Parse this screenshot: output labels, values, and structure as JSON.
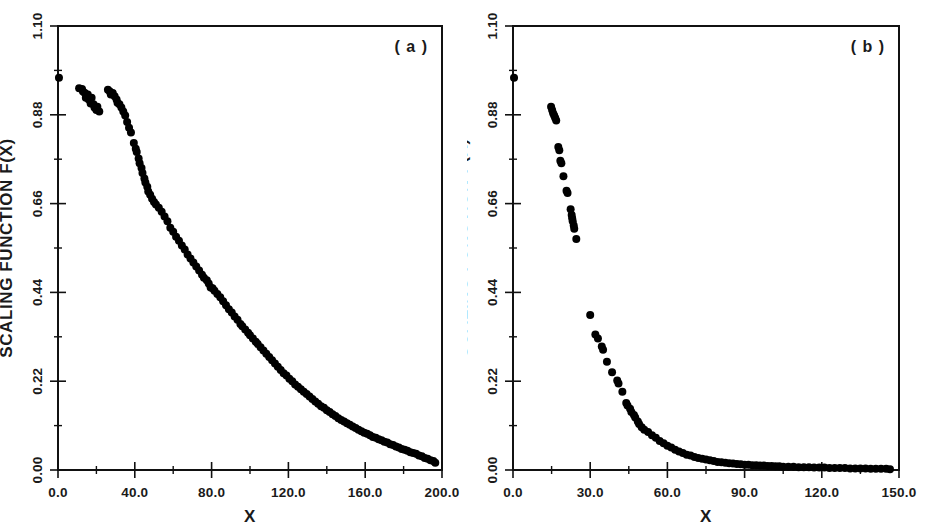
{
  "figure": {
    "panels": [
      {
        "tag": "( a )",
        "xlabel": "X",
        "ylabel": "SCALING FUNCTION F(X)",
        "xticks": [
          "0.0",
          "40.0",
          "80.0",
          "120.0",
          "160.0",
          "200.0"
        ],
        "yticks": [
          "1.10",
          "0.88",
          "0.66",
          "0.44",
          "0.22",
          "0.00"
        ]
      },
      {
        "tag": "( b )",
        "xlabel": "X",
        "ylabel": "SCALING FUNCTION F(X)",
        "xticks": [
          "0.0",
          "30.0",
          "60.0",
          "90.0",
          "120.0",
          "150.0"
        ],
        "yticks": [
          "1.10",
          "0.88",
          "0.66",
          "0.44",
          "0.22",
          "0.00"
        ]
      }
    ]
  },
  "chart_data": [
    {
      "type": "scatter",
      "title": "( a )",
      "xlabel": "X",
      "ylabel": "SCALING FUNCTION F(X)",
      "xlim": [
        0,
        200
      ],
      "ylim": [
        0.0,
        1.1
      ],
      "xticks": [
        0,
        40,
        80,
        120,
        160,
        200
      ],
      "yticks": [
        0.0,
        0.22,
        0.44,
        0.66,
        0.88,
        1.1
      ],
      "xtick_labels": [
        "0.0",
        "40.0",
        "80.0",
        "120.0",
        "160.0",
        "200.0"
      ],
      "ytick_labels": [
        "0.00",
        "0.22",
        "0.44",
        "0.66",
        "0.88",
        "1.10"
      ],
      "grid": false,
      "legend": "none",
      "marker": "filled-circle",
      "marker_color": "#000000",
      "marker_size_px": 8,
      "series": [
        {
          "name": "scaling function (a)",
          "points": [
            [
              0.5,
              0.972
            ],
            [
              11.0,
              0.946
            ],
            [
              12.5,
              0.944
            ],
            [
              13.0,
              0.938
            ],
            [
              14.0,
              0.934
            ],
            [
              14.5,
              0.922
            ],
            [
              15.5,
              0.93
            ],
            [
              16.0,
              0.918
            ],
            [
              17.0,
              0.908
            ],
            [
              17.5,
              0.922
            ],
            [
              18.5,
              0.906
            ],
            [
              19.0,
              0.898
            ],
            [
              20.0,
              0.892
            ],
            [
              20.5,
              0.9
            ],
            [
              21.5,
              0.888
            ],
            [
              26.0,
              0.942
            ],
            [
              27.0,
              0.938
            ],
            [
              27.5,
              0.93
            ],
            [
              28.5,
              0.934
            ],
            [
              29.5,
              0.926
            ],
            [
              30.5,
              0.918
            ],
            [
              31.0,
              0.91
            ],
            [
              32.0,
              0.906
            ],
            [
              33.0,
              0.898
            ],
            [
              34.0,
              0.888
            ],
            [
              35.0,
              0.878
            ],
            [
              36.0,
              0.862
            ],
            [
              37.0,
              0.848
            ],
            [
              38.0,
              0.836
            ],
            [
              39.5,
              0.81
            ],
            [
              40.5,
              0.796
            ],
            [
              41.0,
              0.788
            ],
            [
              42.0,
              0.772
            ],
            [
              42.5,
              0.76
            ],
            [
              43.5,
              0.748
            ],
            [
              44.0,
              0.736
            ],
            [
              45.0,
              0.722
            ],
            [
              45.5,
              0.712
            ],
            [
              46.5,
              0.702
            ],
            [
              47.0,
              0.69
            ],
            [
              48.0,
              0.682
            ],
            [
              49.0,
              0.672
            ],
            [
              50.0,
              0.664
            ],
            [
              51.0,
              0.658
            ],
            [
              52.5,
              0.65
            ],
            [
              54.0,
              0.64
            ],
            [
              55.5,
              0.628
            ],
            [
              57.0,
              0.616
            ],
            [
              58.5,
              0.6
            ],
            [
              60.0,
              0.59
            ],
            [
              61.5,
              0.578
            ],
            [
              63.0,
              0.568
            ],
            [
              64.5,
              0.556
            ],
            [
              66.0,
              0.546
            ],
            [
              67.5,
              0.534
            ],
            [
              69.0,
              0.524
            ],
            [
              70.5,
              0.514
            ],
            [
              72.0,
              0.504
            ],
            [
              73.5,
              0.494
            ],
            [
              75.0,
              0.484
            ],
            [
              76.0,
              0.476
            ],
            [
              77.5,
              0.47
            ],
            [
              78.5,
              0.462
            ],
            [
              79.5,
              0.452
            ],
            [
              80.5,
              0.45
            ],
            [
              81.5,
              0.444
            ],
            [
              83.0,
              0.436
            ],
            [
              84.5,
              0.428
            ],
            [
              86.0,
              0.418
            ],
            [
              87.5,
              0.408
            ],
            [
              89.0,
              0.398
            ],
            [
              90.5,
              0.39
            ],
            [
              92.0,
              0.38
            ],
            [
              93.5,
              0.372
            ],
            [
              95.0,
              0.362
            ],
            [
              96.0,
              0.356
            ],
            [
              97.5,
              0.348
            ],
            [
              99.0,
              0.34
            ],
            [
              100.0,
              0.334
            ],
            [
              101.5,
              0.326
            ],
            [
              103.0,
              0.318
            ],
            [
              104.0,
              0.312
            ],
            [
              105.5,
              0.304
            ],
            [
              107.0,
              0.296
            ],
            [
              108.5,
              0.288
            ],
            [
              110.0,
              0.28
            ],
            [
              111.5,
              0.272
            ],
            [
              113.0,
              0.264
            ],
            [
              114.5,
              0.256
            ],
            [
              116.0,
              0.248
            ],
            [
              117.5,
              0.24
            ],
            [
              119.0,
              0.234
            ],
            [
              120.5,
              0.226
            ],
            [
              122.0,
              0.22
            ],
            [
              123.5,
              0.212
            ],
            [
              125.0,
              0.206
            ],
            [
              126.5,
              0.2
            ],
            [
              128.0,
              0.194
            ],
            [
              129.5,
              0.188
            ],
            [
              131.0,
              0.182
            ],
            [
              132.5,
              0.176
            ],
            [
              134.0,
              0.17
            ],
            [
              135.5,
              0.164
            ],
            [
              137.0,
              0.158
            ],
            [
              138.5,
              0.154
            ],
            [
              140.0,
              0.148
            ],
            [
              141.5,
              0.144
            ],
            [
              143.0,
              0.138
            ],
            [
              144.5,
              0.134
            ],
            [
              146.0,
              0.128
            ],
            [
              147.5,
              0.124
            ],
            [
              149.0,
              0.12
            ],
            [
              150.5,
              0.116
            ],
            [
              152.0,
              0.112
            ],
            [
              153.5,
              0.108
            ],
            [
              155.0,
              0.104
            ],
            [
              156.5,
              0.1
            ],
            [
              158.0,
              0.096
            ],
            [
              159.5,
              0.092
            ],
            [
              161.0,
              0.09
            ],
            [
              162.5,
              0.086
            ],
            [
              164.0,
              0.082
            ],
            [
              165.5,
              0.08
            ],
            [
              167.0,
              0.076
            ],
            [
              168.5,
              0.074
            ],
            [
              170.0,
              0.07
            ],
            [
              171.5,
              0.068
            ],
            [
              173.0,
              0.064
            ],
            [
              174.5,
              0.062
            ],
            [
              176.0,
              0.058
            ],
            [
              177.5,
              0.056
            ],
            [
              179.0,
              0.052
            ],
            [
              180.5,
              0.05
            ],
            [
              182.0,
              0.048
            ],
            [
              183.5,
              0.044
            ],
            [
              185.0,
              0.042
            ],
            [
              186.5,
              0.04
            ],
            [
              188.0,
              0.036
            ],
            [
              189.5,
              0.034
            ],
            [
              191.0,
              0.03
            ],
            [
              192.5,
              0.028
            ],
            [
              194.0,
              0.024
            ],
            [
              195.5,
              0.022
            ],
            [
              196.5,
              0.018
            ]
          ]
        }
      ]
    },
    {
      "type": "scatter",
      "title": "( b )",
      "xlabel": "X",
      "ylabel": "SCALING FUNCTION F(X)",
      "xlim": [
        0,
        150
      ],
      "ylim": [
        0.0,
        1.1
      ],
      "xticks": [
        0,
        30,
        60,
        90,
        120,
        150
      ],
      "yticks": [
        0.0,
        0.22,
        0.44,
        0.66,
        0.88,
        1.1
      ],
      "xtick_labels": [
        "0.0",
        "30.0",
        "60.0",
        "90.0",
        "120.0",
        "150.0"
      ],
      "ytick_labels": [
        "0.00",
        "0.22",
        "0.44",
        "0.66",
        "0.88",
        "1.10"
      ],
      "grid": false,
      "legend": "none",
      "marker": "filled-circle",
      "marker_color": "#000000",
      "marker_size_px": 8,
      "series": [
        {
          "name": "upper branch (b)",
          "points": [
            [
              0.4,
              0.972
            ],
            [
              14.8,
              0.9
            ],
            [
              15.2,
              0.892
            ],
            [
              15.6,
              0.884
            ],
            [
              16.0,
              0.878
            ],
            [
              16.4,
              0.872
            ],
            [
              16.8,
              0.866
            ],
            [
              17.6,
              0.8
            ],
            [
              18.0,
              0.792
            ],
            [
              18.4,
              0.766
            ],
            [
              18.8,
              0.76
            ],
            [
              19.6,
              0.728
            ],
            [
              20.8,
              0.692
            ],
            [
              21.2,
              0.686
            ],
            [
              22.4,
              0.646
            ],
            [
              22.8,
              0.632
            ],
            [
              23.0,
              0.624
            ],
            [
              23.2,
              0.616
            ],
            [
              23.6,
              0.606
            ],
            [
              23.8,
              0.598
            ],
            [
              24.6,
              0.572
            ]
          ]
        },
        {
          "name": "lower branch (b)",
          "points": [
            [
              30.0,
              0.384
            ],
            [
              32.0,
              0.336
            ],
            [
              33.0,
              0.326
            ],
            [
              34.5,
              0.306
            ],
            [
              35.0,
              0.298
            ],
            [
              36.5,
              0.268
            ],
            [
              38.5,
              0.242
            ],
            [
              40.5,
              0.222
            ],
            [
              41.0,
              0.214
            ],
            [
              42.5,
              0.194
            ],
            [
              44.0,
              0.166
            ],
            [
              44.5,
              0.16
            ],
            [
              45.5,
              0.152
            ],
            [
              46.0,
              0.144
            ],
            [
              47.0,
              0.136
            ],
            [
              47.5,
              0.13
            ],
            [
              48.5,
              0.12
            ],
            [
              49.0,
              0.114
            ],
            [
              50.0,
              0.106
            ],
            [
              51.0,
              0.1
            ],
            [
              52.5,
              0.094
            ],
            [
              54.0,
              0.086
            ],
            [
              55.5,
              0.08
            ],
            [
              57.0,
              0.072
            ],
            [
              58.5,
              0.066
            ],
            [
              60.0,
              0.06
            ],
            [
              61.5,
              0.056
            ],
            [
              63.0,
              0.05
            ],
            [
              64.5,
              0.046
            ],
            [
              66.0,
              0.042
            ],
            [
              67.5,
              0.038
            ],
            [
              69.0,
              0.036
            ],
            [
              70.5,
              0.032
            ],
            [
              72.0,
              0.03
            ],
            [
              73.5,
              0.028
            ],
            [
              75.0,
              0.026
            ],
            [
              76.5,
              0.024
            ],
            [
              78.0,
              0.022
            ],
            [
              79.5,
              0.02
            ],
            [
              81.0,
              0.019
            ],
            [
              82.5,
              0.018
            ],
            [
              84.0,
              0.017
            ],
            [
              85.5,
              0.016
            ],
            [
              87.0,
              0.015
            ],
            [
              88.5,
              0.014
            ],
            [
              90.0,
              0.013
            ],
            [
              91.5,
              0.013
            ],
            [
              93.0,
              0.012
            ],
            [
              94.5,
              0.012
            ],
            [
              96.0,
              0.011
            ],
            [
              97.5,
              0.011
            ],
            [
              99.0,
              0.01
            ],
            [
              100.5,
              0.01
            ],
            [
              102.0,
              0.009
            ],
            [
              103.5,
              0.009
            ],
            [
              105.0,
              0.008
            ],
            [
              107.0,
              0.008
            ],
            [
              109.0,
              0.008
            ],
            [
              111.0,
              0.007
            ],
            [
              113.0,
              0.007
            ],
            [
              115.0,
              0.007
            ],
            [
              117.0,
              0.006
            ],
            [
              119.0,
              0.006
            ],
            [
              121.0,
              0.006
            ],
            [
              123.0,
              0.005
            ],
            [
              125.0,
              0.005
            ],
            [
              127.0,
              0.005
            ],
            [
              129.0,
              0.005
            ],
            [
              131.0,
              0.004
            ],
            [
              133.0,
              0.004
            ],
            [
              135.0,
              0.004
            ],
            [
              137.0,
              0.004
            ],
            [
              139.0,
              0.003
            ],
            [
              141.0,
              0.003
            ],
            [
              143.0,
              0.003
            ],
            [
              145.0,
              0.003
            ],
            [
              146.5,
              0.002
            ]
          ]
        }
      ]
    }
  ]
}
